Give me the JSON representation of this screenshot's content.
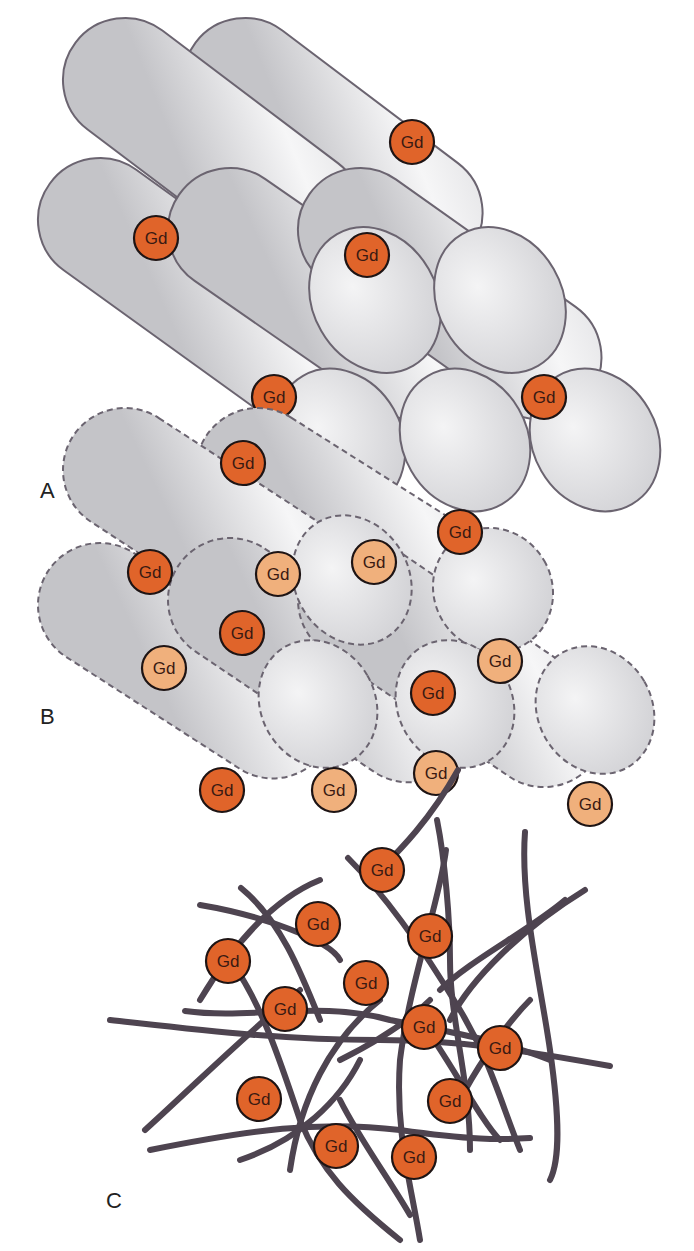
{
  "colors": {
    "gd_dark": "#e0642a",
    "gd_light": "#f0b07c",
    "gd_stroke": "#1e1414",
    "rod_fill_light": "#f4f4f5",
    "rod_fill_dark": "#c9c9cc",
    "rod_stroke": "#6b6470",
    "fiber": "#4e4450"
  },
  "gd_label": "Gd",
  "panels": [
    {
      "id": "A",
      "label": "A",
      "label_pos": [
        40,
        500
      ],
      "style": "solid",
      "rods": [
        {
          "x1": 245,
          "y1": 80,
          "x2": 470,
          "y2": 250
        },
        {
          "x1": 125,
          "y1": 80,
          "x2": 350,
          "y2": 250
        },
        {
          "x1": 100,
          "y1": 220,
          "x2": 340,
          "y2": 393
        },
        {
          "x1": 230,
          "y1": 230,
          "x2": 465,
          "y2": 393
        },
        {
          "x1": 360,
          "y1": 230,
          "x2": 590,
          "y2": 393
        }
      ],
      "ends": [
        {
          "cx": 375,
          "cy": 300,
          "rx": 62,
          "ry": 76
        },
        {
          "cx": 500,
          "cy": 300,
          "rx": 62,
          "ry": 76
        },
        {
          "cx": 340,
          "cy": 440,
          "rx": 62,
          "ry": 74
        },
        {
          "cx": 465,
          "cy": 440,
          "rx": 62,
          "ry": 74
        },
        {
          "cx": 595,
          "cy": 440,
          "rx": 62,
          "ry": 74
        }
      ],
      "gd": [
        {
          "x": 412,
          "y": 142,
          "tone": "dark"
        },
        {
          "x": 156,
          "y": 238,
          "tone": "dark"
        },
        {
          "x": 367,
          "y": 255,
          "tone": "dark"
        },
        {
          "x": 274,
          "y": 397,
          "tone": "dark"
        },
        {
          "x": 544,
          "y": 397,
          "tone": "dark"
        }
      ]
    },
    {
      "id": "B",
      "label": "B",
      "label_pos": [
        40,
        726
      ],
      "style": "dashed",
      "rods": [
        {
          "x1": 258,
          "y1": 470,
          "x2": 495,
          "y2": 620
        },
        {
          "x1": 125,
          "y1": 470,
          "x2": 355,
          "y2": 620
        },
        {
          "x1": 100,
          "y1": 605,
          "x2": 325,
          "y2": 750
        },
        {
          "x1": 230,
          "y1": 600,
          "x2": 460,
          "y2": 755
        },
        {
          "x1": 360,
          "y1": 600,
          "x2": 595,
          "y2": 760
        }
      ],
      "ends": [
        {
          "cx": 352,
          "cy": 580,
          "rx": 57,
          "ry": 67
        },
        {
          "cx": 493,
          "cy": 590,
          "rx": 59,
          "ry": 63
        },
        {
          "cx": 318,
          "cy": 704,
          "rx": 57,
          "ry": 66
        },
        {
          "cx": 455,
          "cy": 704,
          "rx": 57,
          "ry": 66
        },
        {
          "cx": 595,
          "cy": 710,
          "rx": 57,
          "ry": 66
        }
      ],
      "gd": [
        {
          "x": 243,
          "y": 463,
          "tone": "dark"
        },
        {
          "x": 460,
          "y": 532,
          "tone": "dark"
        },
        {
          "x": 374,
          "y": 562,
          "tone": "light"
        },
        {
          "x": 150,
          "y": 572,
          "tone": "dark"
        },
        {
          "x": 278,
          "y": 574,
          "tone": "light"
        },
        {
          "x": 242,
          "y": 633,
          "tone": "dark"
        },
        {
          "x": 164,
          "y": 668,
          "tone": "light"
        },
        {
          "x": 500,
          "y": 661,
          "tone": "light"
        },
        {
          "x": 433,
          "y": 693,
          "tone": "dark"
        },
        {
          "x": 436,
          "y": 773,
          "tone": "light"
        },
        {
          "x": 222,
          "y": 790,
          "tone": "dark"
        },
        {
          "x": 334,
          "y": 790,
          "tone": "light"
        },
        {
          "x": 590,
          "y": 804,
          "tone": "light"
        }
      ]
    },
    {
      "id": "C",
      "label": "C",
      "label_pos": [
        106,
        1210
      ],
      "style": "network",
      "fibers": [
        "M458,770 C430,820 400,850 380,870",
        "M348,858 C390,900 430,960 460,1010 C490,1060 500,1100 520,1150",
        "M241,888 C280,920 300,970 320,1020",
        "M200,905 C260,915 330,940 340,960",
        "M320,880 C270,900 230,950 200,1000",
        "M446,850 C440,900 410,980 400,1060 C395,1130 410,1180 420,1240",
        "M437,820 C445,860 450,920 450,960 C450,1020 470,1080 470,1150",
        "M525,832 C520,900 540,980 550,1050 C560,1120 560,1160 550,1180",
        "M565,900 C530,930 470,960 440,990",
        "M585,890 C520,930 470,980 450,1020",
        "M110,1020 C200,1030 280,1040 380,1040 C460,1040 520,1050 610,1066",
        "M185,1011 C250,1020 320,1000 390,1020 C440,1030 500,1040 550,1060",
        "M150,1150 C250,1130 320,1120 400,1130 C470,1140 500,1140 530,1138",
        "M145,1130 C200,1080 250,1030 300,990",
        "M340,1060 C380,1040 410,1020 430,1000",
        "M230,960 C260,1000 280,1060 300,1120 C320,1170 350,1200 400,1240",
        "M380,1000 C330,1040 300,1100 290,1170",
        "M240,1160 C300,1140 340,1100 360,1060",
        "M420,1020 C450,1060 480,1120 500,1140",
        "M530,1000 C500,1030 470,1080 460,1100",
        "M340,1100 C360,1140 390,1180 410,1215"
      ],
      "gd": [
        {
          "x": 382,
          "y": 870,
          "tone": "dark"
        },
        {
          "x": 318,
          "y": 924,
          "tone": "dark"
        },
        {
          "x": 430,
          "y": 936,
          "tone": "dark"
        },
        {
          "x": 228,
          "y": 961,
          "tone": "dark"
        },
        {
          "x": 366,
          "y": 983,
          "tone": "dark"
        },
        {
          "x": 285,
          "y": 1009,
          "tone": "dark"
        },
        {
          "x": 424,
          "y": 1027,
          "tone": "dark"
        },
        {
          "x": 500,
          "y": 1048,
          "tone": "dark"
        },
        {
          "x": 259,
          "y": 1099,
          "tone": "dark"
        },
        {
          "x": 450,
          "y": 1101,
          "tone": "dark"
        },
        {
          "x": 336,
          "y": 1146,
          "tone": "dark"
        },
        {
          "x": 414,
          "y": 1157,
          "tone": "dark"
        }
      ]
    }
  ]
}
